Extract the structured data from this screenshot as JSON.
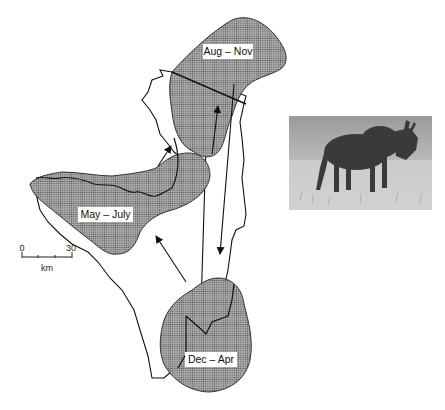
{
  "map": {
    "type": "wildebeest-migration-map",
    "regions": [
      {
        "id": "aug-nov",
        "label": "Aug – Nov"
      },
      {
        "id": "may-july",
        "label": "May – July"
      },
      {
        "id": "dec-apr",
        "label": "Dec – Apr"
      }
    ],
    "scale_bar": {
      "start_label": "0",
      "end_label": "30",
      "unit_label": "km"
    },
    "migration_sequence": [
      "Dec – Apr",
      "May – July",
      "Aug – Nov",
      "Dec – Apr"
    ],
    "photo": {
      "subject": "wildebeest"
    },
    "colors": {
      "range_fill": "#8a8a8a",
      "outline": "#111111",
      "background": "#ffffff"
    }
  }
}
